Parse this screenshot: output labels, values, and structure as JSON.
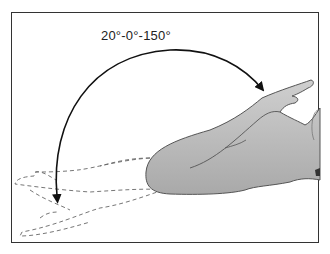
{
  "diagram": {
    "type": "range-of-motion-illustration",
    "label": "20°-0°-150°",
    "elements": [
      {
        "name": "range-arc-arrow",
        "style": "solid double-headed curved arrow"
      },
      {
        "name": "arm-flexed",
        "style": "gray filled silhouette"
      },
      {
        "name": "arm-extended-ghost",
        "style": "dashed outline"
      }
    ],
    "colors": {
      "frame": "#333333",
      "arm_fill": "#bdbdbd",
      "arm_stroke": "#555555",
      "dashed": "#666666",
      "arrow": "#111111"
    }
  }
}
